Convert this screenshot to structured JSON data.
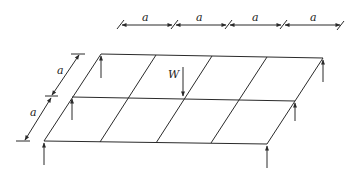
{
  "diagram": {
    "labels": {
      "span_top_1": "a",
      "span_top_2": "a",
      "span_top_3": "a",
      "span_top_4": "a",
      "side_1": "a",
      "side_2": "a",
      "load": "W"
    },
    "grid": {
      "columns": 4,
      "rows": 2,
      "bay_size": "a"
    },
    "supports": [
      "top-left",
      "top-right",
      "middle-left",
      "middle-right",
      "bottom-left",
      "bottom-right"
    ],
    "colors": {
      "line": "#2a2a2a",
      "background": "#ffffff"
    }
  }
}
